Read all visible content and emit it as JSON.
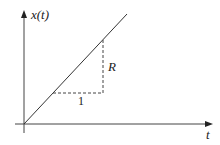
{
  "diagram": {
    "y_axis_label": "x(t)",
    "x_axis_label": "t",
    "run_label": "1",
    "rise_label": "R",
    "colors": {
      "line": "#333333",
      "axis": "#444444",
      "text": "#222222"
    }
  }
}
